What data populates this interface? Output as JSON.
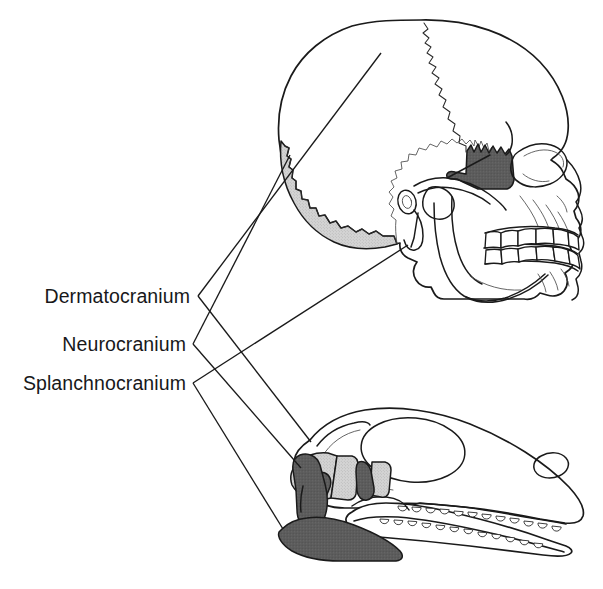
{
  "labels": [
    {
      "id": "dermatocranium",
      "text": "Dermatocranium",
      "shading": "white",
      "text_x": 196,
      "text_y": 303,
      "bracket_apex_x": 198,
      "bracket_apex_y": 296
    },
    {
      "id": "neurocranium",
      "text": "Neurocranium",
      "shading": "light-gray",
      "text_x": 191,
      "text_y": 351,
      "bracket_apex_x": 193,
      "bracket_apex_y": 344
    },
    {
      "id": "splanchnocranium",
      "text": "Splanchnocranium",
      "shading": "dark-gray",
      "text_x": 191,
      "text_y": 390,
      "bracket_apex_x": 193,
      "bracket_apex_y": 383
    }
  ],
  "specimens": [
    {
      "id": "human-skull",
      "name": "Human skull lateral view",
      "position": "top"
    },
    {
      "id": "reptile-skull",
      "name": "Reptile skull lateral view",
      "position": "bottom"
    }
  ],
  "colors": {
    "background": "#ffffff",
    "outline": "#1a1a1a",
    "text": "#18181a",
    "shade_light": "#d0d0d0",
    "shade_dark": "#5a5a5a",
    "bone_fill": "#ffffff"
  }
}
